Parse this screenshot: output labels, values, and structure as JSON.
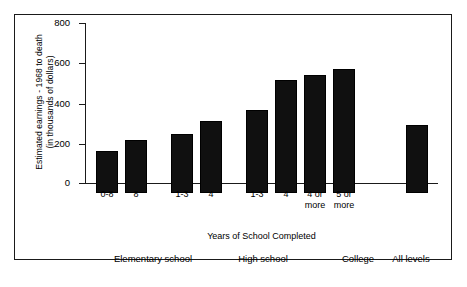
{
  "chart_data": {
    "type": "bar",
    "title": "",
    "xlabel": "Years of School Completed",
    "ylabel": "Estimated earnings - 1968 to death\n(in thousands of dollars)",
    "ylabel_line1": "Estimated earnings - 1968 to death",
    "ylabel_line2": "(in thousands of dollars)",
    "ylim": [
      0,
      800
    ],
    "ytick_values": [
      800,
      600,
      400,
      200,
      0
    ],
    "ytick_labels": [
      "800",
      "600",
      "400",
      "200",
      "0"
    ],
    "grid": false,
    "legend": false,
    "categories": [
      "0-8",
      "8",
      "1-3",
      "4",
      "1-3",
      "4",
      "4 or\nmore",
      "5 or\nmore",
      ""
    ],
    "values": [
      210,
      265,
      295,
      360,
      415,
      565,
      590,
      620,
      340
    ],
    "bars": [
      {
        "label": "0-8",
        "value": 210,
        "group": "Elementary school"
      },
      {
        "label": "8",
        "value": 265,
        "group": "Elementary school"
      },
      {
        "label": "1-3",
        "value": 295,
        "group": "High school"
      },
      {
        "label": "4",
        "value": 360,
        "group": "High school"
      },
      {
        "label": "1-3",
        "value": 415,
        "group": "College"
      },
      {
        "label": "4",
        "value": 565,
        "group": "College"
      },
      {
        "label": "4 or\nmore",
        "value": 590,
        "group": "College"
      },
      {
        "label": "5 or\nmore",
        "value": 620,
        "group": "College"
      },
      {
        "label": "",
        "value": 340,
        "group": "All levels"
      }
    ],
    "group_labels": [
      "Elementary school",
      "High school",
      "College",
      "All levels"
    ],
    "bar_color": "#101010",
    "axis_color": "#1a1a1a",
    "background_color": "#ffffff"
  }
}
